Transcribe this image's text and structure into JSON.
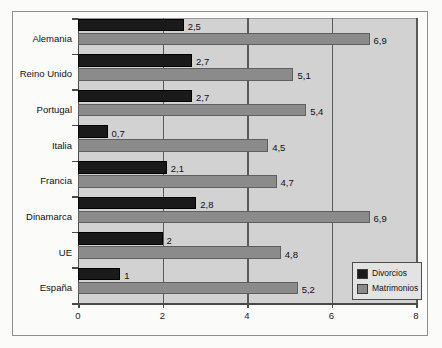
{
  "chart_data": {
    "type": "bar",
    "orientation": "horizontal",
    "title": "",
    "xlabel": "",
    "ylabel": "",
    "xlim": [
      0,
      8
    ],
    "xticks": [
      "0",
      "2",
      "4",
      "6",
      "8"
    ],
    "xtick_values": [
      0,
      2,
      4,
      6,
      8
    ],
    "grid": true,
    "grid_axis": "x",
    "legend_position": "bottom-right",
    "categories": [
      "Alemania",
      "Reino Unido",
      "Portugal",
      "Italia",
      "Francia",
      "Dinamarca",
      "UE",
      "España"
    ],
    "series": [
      {
        "name": "Divorcios",
        "color": "#1a1a1a",
        "values": [
          2.5,
          2.7,
          2.7,
          0.7,
          2.1,
          2.8,
          2,
          1
        ],
        "labels": [
          "2,5",
          "2,7",
          "2,7",
          "0,7",
          "2,1",
          "2,8",
          "2",
          "1"
        ]
      },
      {
        "name": "Matrimonios",
        "color": "#8b8b8b",
        "values": [
          6.9,
          5.1,
          5.4,
          4.5,
          4.7,
          6.9,
          4.8,
          5.2
        ],
        "labels": [
          "6,9",
          "5,1",
          "5,4",
          "4,5",
          "4,7",
          "6,9",
          "4,8",
          "5,2"
        ]
      }
    ]
  },
  "legend": {
    "items": [
      {
        "label": "Divorcios",
        "swatch": "sw-div"
      },
      {
        "label": "Matrimonios",
        "swatch": "sw-mat"
      }
    ]
  }
}
